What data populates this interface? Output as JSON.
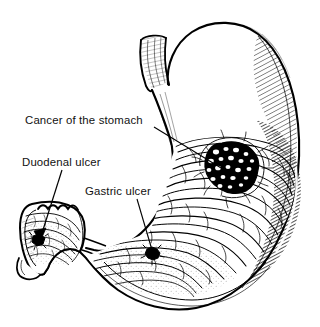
{
  "figure": {
    "view": "sagittal cut-away line drawing of the stomach and duodenal cap",
    "background_color": "#ffffff",
    "ink_color": "#000000",
    "width": 320,
    "height": 327
  },
  "annotations": [
    {
      "id": "cancer-of-the-stomach",
      "label": "Cancer of the stomach",
      "label_x": 25,
      "label_y": 124,
      "leader": {
        "x1": 154,
        "y1": 127,
        "x2": 226,
        "y2": 171
      },
      "marker": "nodular-mass",
      "target_x": 228,
      "target_y": 170
    },
    {
      "id": "duodenal-ulcer",
      "label": "Duodenal ulcer",
      "label_x": 22,
      "label_y": 166,
      "leader": {
        "x1": 62,
        "y1": 170,
        "x2": 40,
        "y2": 238
      },
      "marker": "arrowhead-crater",
      "target_x": 38,
      "target_y": 241
    },
    {
      "id": "gastric-ulcer",
      "label": "Gastric ulcer",
      "label_x": 85,
      "label_y": 195,
      "leader": {
        "x1": 137,
        "y1": 199,
        "x2": 152,
        "y2": 250
      },
      "marker": "dark-crater",
      "target_x": 152,
      "target_y": 254
    }
  ],
  "anatomy": {
    "parts": [
      {
        "name": "esophagus",
        "shading": "light parallel hatching"
      },
      {
        "name": "fundus",
        "shading": "none (white)"
      },
      {
        "name": "body-of-stomach",
        "shading": "rugal folds"
      },
      {
        "name": "greater-curvature",
        "shading": "dense diagonal hatching"
      },
      {
        "name": "antrum",
        "shading": "rugal folds"
      },
      {
        "name": "pylorus",
        "shading": "outline"
      },
      {
        "name": "duodenal-cap",
        "shading": "scalloped folds"
      }
    ]
  },
  "lesions": [
    {
      "name": "gastric-carcinoma",
      "appearance": "dark cauliflower mass with pale nodules"
    },
    {
      "name": "gastric-ulcer",
      "appearance": "small punched-out dark crater"
    },
    {
      "name": "duodenal-ulcer",
      "appearance": "small dark crater in duodenal cap"
    }
  ]
}
